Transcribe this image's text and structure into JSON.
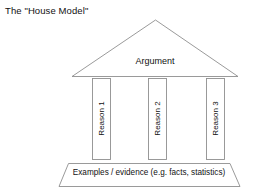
{
  "diagram": {
    "title": "The \"House Model\"",
    "type": "house-model-argument-diagram",
    "roof": {
      "label": "Argument",
      "shape": "triangle",
      "stroke_color": "#8f8f8f",
      "fill_color": "#ffffff"
    },
    "pillars": [
      {
        "label": "Reason 1",
        "orientation": "vertical-bottom-to-top"
      },
      {
        "label": "Reason 2",
        "orientation": "vertical-bottom-to-top"
      },
      {
        "label": "Reason 3",
        "orientation": "vertical-bottom-to-top"
      }
    ],
    "foundation": {
      "label": "Examples / evidence (e.g. facts, statistics)",
      "shape": "trapezoid",
      "stroke_color": "#8f8f8f",
      "fill_color": "#ffffff"
    },
    "background_color": "#ffffff",
    "text_color": "#111111"
  }
}
